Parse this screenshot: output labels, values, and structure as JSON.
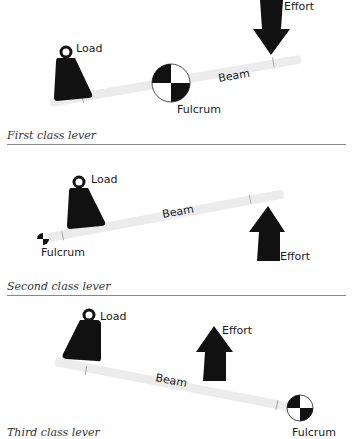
{
  "colors": {
    "ink": "#111111",
    "beam": "#ececec",
    "rule": "#888888",
    "caption": "#333333"
  },
  "panels": [
    {
      "caption": "First class lever",
      "labels": {
        "load": "Load",
        "effort": "Effort",
        "beam": "Beam",
        "fulcrum": "Fulcrum"
      },
      "icons": {
        "weight": "weight-icon",
        "fulcrum": "fulcrum-icon",
        "arrow": "arrow-down-icon"
      }
    },
    {
      "caption": "Second class lever",
      "labels": {
        "load": "Load",
        "effort": "Effort",
        "beam": "Beam",
        "fulcrum": "Fulcrum"
      },
      "icons": {
        "weight": "weight-icon",
        "fulcrum": "fulcrum-icon",
        "arrow": "arrow-up-icon"
      }
    },
    {
      "caption": "Third class lever",
      "labels": {
        "load": "Load",
        "effort": "Effort",
        "beam": "Beam",
        "fulcrum": "Fulcrum"
      },
      "icons": {
        "weight": "weight-icon",
        "fulcrum": "fulcrum-icon",
        "arrow": "arrow-up-icon"
      }
    }
  ]
}
